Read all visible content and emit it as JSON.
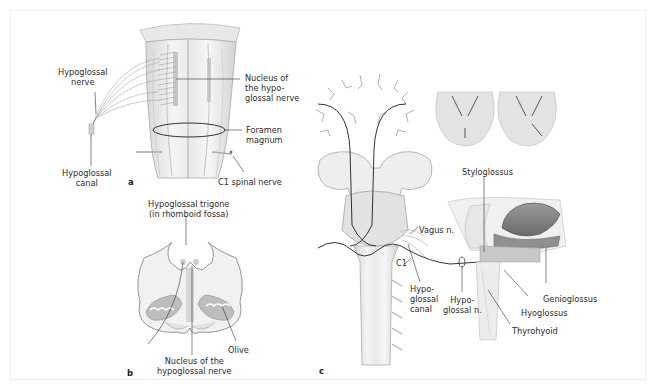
{
  "figure": {
    "panels": [
      {
        "id": "a",
        "letter": "a",
        "labels": {
          "hypoglossal_nerve": [
            "Hypoglossal",
            "nerve"
          ],
          "nucleus": [
            "Nucleus of",
            "the hypo-",
            "glossal nerve"
          ],
          "foramen_magnum": [
            "Foramen",
            "magnum"
          ],
          "hypoglossal_canal": [
            "Hypoglossal",
            "canal"
          ],
          "c1_spinal_nerve": "C1 spinal nerve"
        }
      },
      {
        "id": "b",
        "letter": "b",
        "labels": {
          "trigone": [
            "Hypoglossal trigone",
            "(in rhomboid fossa)"
          ],
          "olive": "Olive",
          "nucleus": [
            "Nucleus of the",
            "hypoglossal nerve"
          ]
        }
      },
      {
        "id": "c",
        "letter": "c",
        "labels": {
          "styloglossus": "Styloglossus",
          "vagus": "Vagus n.",
          "c1": "C1",
          "hypoglossal_canal": [
            "Hypo-",
            "glossal",
            "canal"
          ],
          "hypoglossal_n": [
            "Hypo-",
            "glossal n."
          ],
          "genioglossus": "Genioglossus",
          "hyoglossus": "Hyoglossus",
          "thyrohyoid": "Thyrohyoid"
        }
      }
    ],
    "colors": {
      "background": "#ffffff",
      "line": "#333333",
      "tissue": "#e6e6e6",
      "tissue_dark": "#9a9a9a",
      "tongue": "#8a8a8a"
    }
  }
}
